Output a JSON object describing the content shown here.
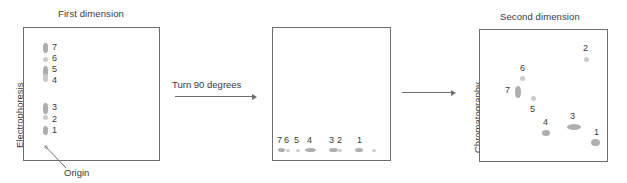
{
  "figure": {
    "kind": "two-dimensional-separation-diagram",
    "ink_color": "#3a3a3a",
    "panel_border_color": "#6e6e6e",
    "spot_color": "#b9b9b9"
  },
  "panel_first": {
    "title": "First dimension",
    "axis_label": "Electrophoresis",
    "origin_label": "Origin",
    "spot_labels": [
      "7",
      "6",
      "5",
      "4",
      "3",
      "2",
      "1"
    ],
    "spots": [
      {
        "label": "7",
        "x": 43,
        "y": 43,
        "w": 5,
        "h": 10,
        "shade": "dark"
      },
      {
        "label": "6",
        "x": 43,
        "y": 57,
        "w": 5,
        "h": 5,
        "shade": "light"
      },
      {
        "label": "5",
        "x": 43,
        "y": 66,
        "w": 5,
        "h": 11,
        "shade": "dark"
      },
      {
        "label": "4",
        "x": 43,
        "y": 74,
        "w": 5,
        "h": 8,
        "shade": "light"
      },
      {
        "label": "3",
        "x": 43,
        "y": 103,
        "w": 5,
        "h": 11,
        "shade": "dark"
      },
      {
        "label": "2",
        "x": 43,
        "y": 115,
        "w": 5,
        "h": 5,
        "shade": "light"
      },
      {
        "label": "1",
        "x": 43,
        "y": 126,
        "w": 5,
        "h": 9,
        "shade": "dark"
      },
      {
        "label": "origin",
        "x": 44,
        "y": 145,
        "w": 4,
        "h": 4,
        "shade": "light"
      }
    ]
  },
  "panel_turned": {
    "title": "",
    "spot_labels": [
      "7",
      "6",
      "5",
      "4",
      "3",
      "2",
      "1"
    ],
    "spots": [
      {
        "label": "7",
        "x": 278,
        "y": 148,
        "w": 7,
        "h": 4,
        "shade": "dark"
      },
      {
        "label": "6",
        "x": 286,
        "y": 149,
        "w": 4,
        "h": 3,
        "shade": "light"
      },
      {
        "label": "5",
        "x": 296,
        "y": 149,
        "w": 4,
        "h": 3,
        "shade": "light"
      },
      {
        "label": "4",
        "x": 305,
        "y": 148,
        "w": 11,
        "h": 4,
        "shade": "dark"
      },
      {
        "label": "3",
        "x": 329,
        "y": 148,
        "w": 9,
        "h": 4,
        "shade": "dark"
      },
      {
        "label": "2",
        "x": 338,
        "y": 149,
        "w": 4,
        "h": 3,
        "shade": "light"
      },
      {
        "label": "1",
        "x": 355,
        "y": 148,
        "w": 8,
        "h": 4,
        "shade": "dark"
      },
      {
        "label": "origin",
        "x": 372,
        "y": 149,
        "w": 4,
        "h": 3,
        "shade": "light"
      }
    ]
  },
  "panel_second": {
    "title": "Second dimension",
    "axis_label": "Chromatography",
    "spot_labels": [
      "7",
      "6",
      "5",
      "4",
      "3",
      "2",
      "1"
    ],
    "spots": [
      {
        "label": "2",
        "x": 584,
        "y": 57,
        "w": 5,
        "h": 5,
        "shade": "light"
      },
      {
        "label": "6",
        "x": 520,
        "y": 76,
        "w": 5,
        "h": 5,
        "shade": "light"
      },
      {
        "label": "7",
        "x": 515,
        "y": 86,
        "w": 6,
        "h": 12,
        "shade": "dark"
      },
      {
        "label": "5",
        "x": 531,
        "y": 96,
        "w": 5,
        "h": 5,
        "shade": "light"
      },
      {
        "label": "4",
        "x": 542,
        "y": 130,
        "w": 8,
        "h": 6,
        "shade": "dark"
      },
      {
        "label": "3",
        "x": 567,
        "y": 124,
        "w": 14,
        "h": 6,
        "shade": "dark"
      },
      {
        "label": "1",
        "x": 591,
        "y": 139,
        "w": 9,
        "h": 7,
        "shade": "dark"
      }
    ]
  },
  "transitions": {
    "turn_caption": "Turn 90 degrees",
    "turn_arrow": "arrow-right-icon",
    "flow_arrow": "arrow-right-icon"
  }
}
